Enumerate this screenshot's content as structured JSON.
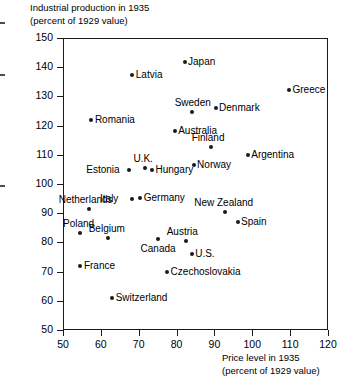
{
  "chart_data": {
    "type": "scatter",
    "title": "",
    "ylabel": "Industrial production in 1935",
    "ylabel_sub": "(percent of 1929 value)",
    "xlabel": "Price level in 1935",
    "xlabel_sub": "(percent of 1929 value)",
    "xlim": [
      50,
      120
    ],
    "ylim": [
      50,
      150
    ],
    "xticks": [
      50,
      60,
      70,
      80,
      90,
      100,
      110,
      120
    ],
    "yticks": [
      50,
      60,
      70,
      80,
      90,
      100,
      110,
      120,
      130,
      140,
      150
    ],
    "grid": false,
    "legend": "none",
    "marker_color": "#1a1a1a",
    "axis_color": "#1a1a1a",
    "points": [
      {
        "name": "Japan",
        "x": 82.1,
        "y": 141.8,
        "label_pos": "right"
      },
      {
        "name": "Latvia",
        "x": 68.3,
        "y": 137.3,
        "label_pos": "right"
      },
      {
        "name": "Greece",
        "x": 109.7,
        "y": 132.2,
        "label_pos": "right"
      },
      {
        "name": "Denmark",
        "x": 90.3,
        "y": 126.0,
        "label_pos": "right"
      },
      {
        "name": "Sweden",
        "x": 84.0,
        "y": 124.5,
        "label_pos": "above"
      },
      {
        "name": "Romania",
        "x": 57.5,
        "y": 122.0,
        "label_pos": "right"
      },
      {
        "name": "Australia",
        "x": 79.5,
        "y": 118.0,
        "label_pos": "right"
      },
      {
        "name": "Finland",
        "x": 89.2,
        "y": 112.7,
        "label_pos": "above"
      },
      {
        "name": "Argentina",
        "x": 98.8,
        "y": 109.9,
        "label_pos": "right"
      },
      {
        "name": "Norway",
        "x": 84.5,
        "y": 106.5,
        "label_pos": "right"
      },
      {
        "name": "U.K.",
        "x": 71.7,
        "y": 105.5,
        "label_pos": "above"
      },
      {
        "name": "Hungary",
        "x": 73.5,
        "y": 104.8,
        "label_pos": "right"
      },
      {
        "name": "Estonia",
        "x": 67.5,
        "y": 104.8,
        "label_pos": "left"
      },
      {
        "name": "Italy",
        "x": 68.3,
        "y": 94.9,
        "label_pos": "left"
      },
      {
        "name": "Germany",
        "x": 70.4,
        "y": 95.2,
        "label_pos": "right"
      },
      {
        "name": "New Zealand",
        "x": 92.7,
        "y": 90.4,
        "label_pos": "above"
      },
      {
        "name": "Netherlands",
        "x": 56.9,
        "y": 91.4,
        "label_pos": "above"
      },
      {
        "name": "Spain",
        "x": 96.1,
        "y": 87.0,
        "label_pos": "right"
      },
      {
        "name": "Poland",
        "x": 54.5,
        "y": 83.2,
        "label_pos": "above"
      },
      {
        "name": "Belgium",
        "x": 62.0,
        "y": 81.6,
        "label_pos": "above"
      },
      {
        "name": "Canada",
        "x": 75.0,
        "y": 81.0,
        "label_pos": "below"
      },
      {
        "name": "Austria",
        "x": 82.6,
        "y": 80.5,
        "label_pos": "above"
      },
      {
        "name": "U.S.",
        "x": 84.0,
        "y": 76.0,
        "label_pos": "right"
      },
      {
        "name": "France",
        "x": 54.6,
        "y": 72.0,
        "label_pos": "right"
      },
      {
        "name": "Czechoslovakia",
        "x": 77.5,
        "y": 69.8,
        "label_pos": "right"
      },
      {
        "name": "Switzerland",
        "x": 63.0,
        "y": 61.0,
        "label_pos": "right"
      }
    ]
  }
}
